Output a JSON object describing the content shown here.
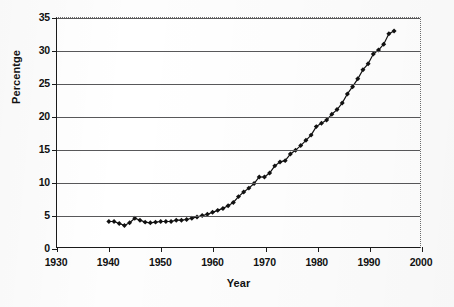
{
  "chart_data": {
    "type": "line",
    "title": "",
    "xlabel": "Year",
    "ylabel": "Percentge",
    "xlim": [
      1930,
      2000
    ],
    "ylim": [
      0,
      35
    ],
    "x_ticks": [
      1930,
      1940,
      1950,
      1960,
      1970,
      1980,
      1990,
      2000
    ],
    "y_ticks": [
      0,
      5,
      10,
      15,
      20,
      25,
      30,
      35
    ],
    "x_tick_labels": [
      "1930",
      "1940",
      "1950",
      "1960",
      "1970",
      "1980",
      "1990",
      "2000"
    ],
    "y_tick_labels": [
      "0",
      "5",
      "10",
      "15",
      "20",
      "25",
      "30",
      "35"
    ],
    "grid": "horizontal",
    "legend": "none",
    "marker": "filled-diamond",
    "line_color": "#111111",
    "marker_color": "#111111",
    "series": [
      {
        "name": "Percentge",
        "x": [
          1940,
          1941,
          1942,
          1943,
          1944,
          1945,
          1946,
          1947,
          1948,
          1949,
          1950,
          1951,
          1952,
          1953,
          1954,
          1955,
          1956,
          1957,
          1958,
          1959,
          1960,
          1961,
          1962,
          1963,
          1964,
          1965,
          1966,
          1967,
          1968,
          1969,
          1970,
          1971,
          1972,
          1973,
          1974,
          1975,
          1976,
          1977,
          1978,
          1979,
          1980,
          1981,
          1982,
          1983,
          1984,
          1985,
          1986,
          1987,
          1988,
          1989,
          1990,
          1991,
          1992,
          1993,
          1994,
          1995
        ],
        "values": [
          3.9,
          3.9,
          3.6,
          3.3,
          3.7,
          4.4,
          4.1,
          3.8,
          3.7,
          3.8,
          3.9,
          3.9,
          3.9,
          4.1,
          4.1,
          4.2,
          4.4,
          4.6,
          4.8,
          5.0,
          5.3,
          5.6,
          5.9,
          6.3,
          6.8,
          7.7,
          8.4,
          9.0,
          9.7,
          10.7,
          10.7,
          11.3,
          12.4,
          13.0,
          13.2,
          14.2,
          14.8,
          15.5,
          16.3,
          17.1,
          18.4,
          18.9,
          19.4,
          20.3,
          21.0,
          22.0,
          23.4,
          24.5,
          25.7,
          27.1,
          28.0,
          29.5,
          30.1,
          31.0,
          32.6,
          33.0
        ]
      }
    ]
  }
}
